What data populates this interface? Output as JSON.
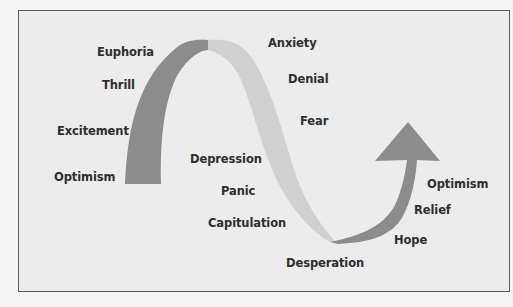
{
  "diagram": {
    "title": "",
    "colors": {
      "background": "#ececec",
      "border": "#5a5a5a",
      "rising_band": "#8c8c8c",
      "falling_band": "#d0d0d0",
      "recovery_arrow": "#8c8c8c",
      "label_text": "#2e2e2e"
    },
    "stages": [
      {
        "id": "optimism-start",
        "label": "Optimism"
      },
      {
        "id": "excitement",
        "label": "Excitement"
      },
      {
        "id": "thrill",
        "label": "Thrill"
      },
      {
        "id": "euphoria",
        "label": "Euphoria"
      },
      {
        "id": "anxiety",
        "label": "Anxiety"
      },
      {
        "id": "denial",
        "label": "Denial"
      },
      {
        "id": "fear",
        "label": "Fear"
      },
      {
        "id": "depression",
        "label": "Depression"
      },
      {
        "id": "panic",
        "label": "Panic"
      },
      {
        "id": "capitulation",
        "label": "Capitulation"
      },
      {
        "id": "desperation",
        "label": "Desperation"
      },
      {
        "id": "hope",
        "label": "Hope"
      },
      {
        "id": "relief",
        "label": "Relief"
      },
      {
        "id": "optimism-end",
        "label": "Optimism"
      }
    ]
  }
}
